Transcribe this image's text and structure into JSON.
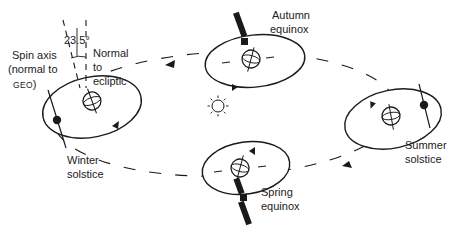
{
  "diagram": {
    "type": "orbital-geometry",
    "sun": {
      "icon": "sun-icon",
      "position": [
        218,
        106
      ]
    },
    "labels": {
      "angle": "23.5°",
      "spin_axis_line1": "Spin axis",
      "spin_axis_line2": "(normal to",
      "spin_axis_geo": "GEO",
      "spin_axis_close": ")",
      "normal_line1": "Normal",
      "normal_line2": "to",
      "normal_line3": "ecliptic"
    },
    "positions": [
      {
        "id": "autumn",
        "line1": "Autumn",
        "line2": "equinox"
      },
      {
        "id": "winter",
        "line1": "Winter",
        "line2": "solstice"
      },
      {
        "id": "spring",
        "line1": "Spring",
        "line2": "equinox"
      },
      {
        "id": "summer",
        "line1": "Summer",
        "line2": "solstice"
      }
    ],
    "colors": {
      "ink": "#1a1a1a",
      "background": "#ffffff"
    }
  }
}
